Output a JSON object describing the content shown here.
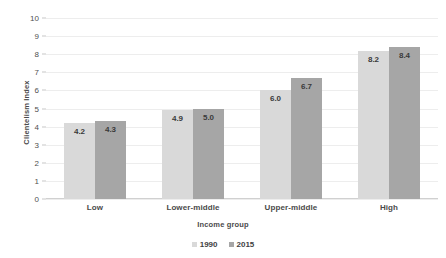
{
  "chart_data": {
    "type": "bar",
    "title": "",
    "xlabel": "Income group",
    "ylabel": "Clientelism Index",
    "categories": [
      "Low",
      "Lower-middle",
      "Upper-middle",
      "High"
    ],
    "series": [
      {
        "name": "1990",
        "values": [
          4.2,
          4.9,
          6.0,
          8.2
        ],
        "color": "#d9d9d9"
      },
      {
        "name": "2015",
        "values": [
          4.3,
          5.0,
          6.7,
          8.4
        ],
        "color": "#a6a6a6"
      }
    ],
    "data_labels": [
      [
        "4.2",
        "4.9",
        "6.0",
        "8.2"
      ],
      [
        "4.3",
        "5.0",
        "6.7",
        "8.4"
      ]
    ],
    "ylim": [
      0,
      10
    ],
    "ytick_labels": [
      "10",
      "9",
      "8",
      "7",
      "6",
      "5",
      "4",
      "3",
      "2",
      "1",
      "0"
    ],
    "ytick_values": [
      10,
      9,
      8,
      7,
      6,
      5,
      4,
      3,
      2,
      1,
      0
    ],
    "grid": true,
    "grid_axis": "y",
    "legend_position": "bottom-center",
    "background_color": "#ffffff",
    "gridline_color": "#ededed"
  }
}
